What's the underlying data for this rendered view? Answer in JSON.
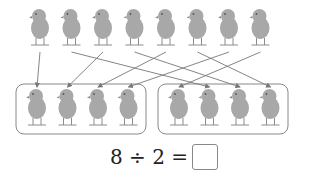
{
  "diagram": {
    "top_row_count": 8,
    "groups": [
      {
        "name": "group-1",
        "count": 4
      },
      {
        "name": "group-2",
        "count": 4
      }
    ],
    "arrows": [
      {
        "from": 0,
        "to": 0
      },
      {
        "from": 1,
        "to": 5
      },
      {
        "from": 2,
        "to": 1
      },
      {
        "from": 3,
        "to": 6
      },
      {
        "from": 4,
        "to": 2
      },
      {
        "from": 5,
        "to": 7
      },
      {
        "from": 6,
        "to": 3
      },
      {
        "from": 7,
        "to": 4
      }
    ],
    "colors": {
      "chick": "#a8a8a8",
      "chick_dark": "#8c8c8c",
      "arrow": "#777777",
      "box": "#888888"
    }
  },
  "equation": {
    "text": "8 ÷ 2 =",
    "answer": ""
  }
}
